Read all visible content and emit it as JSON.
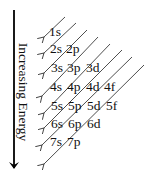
{
  "diagram": {
    "title": "",
    "axis": {
      "label": "Increasing Energy",
      "direction": "down"
    },
    "rows": [
      {
        "n": 1,
        "orbitals": [
          "1s"
        ]
      },
      {
        "n": 2,
        "orbitals": [
          "2s",
          "2p"
        ]
      },
      {
        "n": 3,
        "orbitals": [
          "3s",
          "3p",
          "3d"
        ]
      },
      {
        "n": 4,
        "orbitals": [
          "4s",
          "4p",
          "4d",
          "4f"
        ]
      },
      {
        "n": 5,
        "orbitals": [
          "5s",
          "5p",
          "5d",
          "5f"
        ]
      },
      {
        "n": 6,
        "orbitals": [
          "6s",
          "6p",
          "6d"
        ]
      },
      {
        "n": 7,
        "orbitals": [
          "7s",
          "7p"
        ]
      }
    ],
    "filling_order": [
      "1s",
      "2s",
      "2p",
      "3s",
      "3p",
      "4s",
      "3d",
      "4p",
      "5s",
      "4d",
      "5p",
      "6s",
      "4f",
      "5d",
      "6p",
      "7s",
      "5f",
      "6d",
      "7p"
    ],
    "diagonal_arrow_count": 8,
    "colors": {
      "ink": "#111111",
      "background": "#ffffff"
    }
  }
}
